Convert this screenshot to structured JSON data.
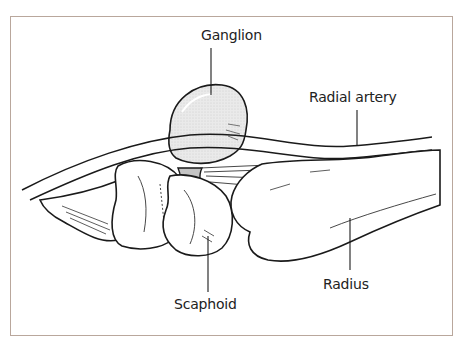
{
  "figure": {
    "border_color": "#b9a79c",
    "line_color": "#1a1a1a",
    "ganglion_fill": "#e6e6e6",
    "ganglion_stalk_fill": "#bdbdbd"
  },
  "labels": [
    {
      "id": "ganglion",
      "text": "Ganglion",
      "x": 201,
      "y": 28
    },
    {
      "id": "radial_artery",
      "text": "Radial artery",
      "x": 309,
      "y": 90
    },
    {
      "id": "radius",
      "text": "Radius",
      "x": 323,
      "y": 277
    },
    {
      "id": "scaphoid",
      "text": "Scaphoid",
      "x": 174,
      "y": 297
    }
  ]
}
